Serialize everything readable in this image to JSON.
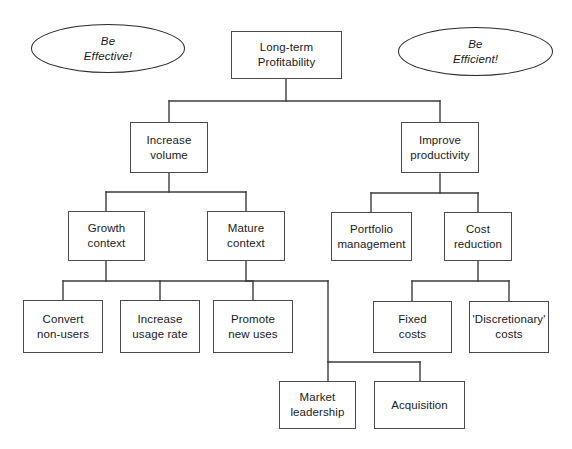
{
  "diagram": {
    "canvas": {
      "width": 572,
      "height": 449
    },
    "style": {
      "box_border_color": "#4a4a4a",
      "oval_border_color": "#2b2b2b",
      "edge_color": "#3c3c3c",
      "background": "#ffffff",
      "text_color": "#1a1a1a"
    },
    "ovals": [
      {
        "id": "be-effective",
        "label": "Be\nEffective!",
        "x": 31,
        "y": 24,
        "w": 154,
        "h": 49
      },
      {
        "id": "be-efficient",
        "label": "Be\nEfficient!",
        "x": 398,
        "y": 27,
        "w": 155,
        "h": 49
      }
    ],
    "nodes": [
      {
        "id": "long-term-profitability",
        "label": "Long-term\nProfitability",
        "level": 0,
        "x": 231,
        "y": 31,
        "w": 111,
        "h": 48
      },
      {
        "id": "increase-volume",
        "label": "Increase\nvolume",
        "level": 1,
        "x": 130,
        "y": 122,
        "w": 78,
        "h": 51
      },
      {
        "id": "improve-productivity",
        "label": "Improve\nproductivity",
        "level": 1,
        "x": 401,
        "y": 122,
        "w": 78,
        "h": 51
      },
      {
        "id": "growth-context",
        "label": "Growth\ncontext",
        "level": 2,
        "x": 68,
        "y": 211,
        "w": 77,
        "h": 50
      },
      {
        "id": "mature-context",
        "label": "Mature\ncontext",
        "level": 2,
        "x": 207,
        "y": 211,
        "w": 78,
        "h": 50
      },
      {
        "id": "portfolio-management",
        "label": "Portfolio\nmanagement",
        "level": 2,
        "x": 331,
        "y": 212,
        "w": 81,
        "h": 49
      },
      {
        "id": "cost-reduction",
        "label": "Cost\nreduction",
        "level": 2,
        "x": 444,
        "y": 212,
        "w": 68,
        "h": 49
      },
      {
        "id": "convert-non-users",
        "label": "Convert\nnon-users",
        "level": 3,
        "x": 23,
        "y": 300,
        "w": 80,
        "h": 53
      },
      {
        "id": "increase-usage-rate",
        "label": "Increase\nusage rate",
        "level": 3,
        "x": 120,
        "y": 300,
        "w": 80,
        "h": 53
      },
      {
        "id": "promote-new-uses",
        "label": "Promote\nnew uses",
        "level": 3,
        "x": 213,
        "y": 300,
        "w": 80,
        "h": 53
      },
      {
        "id": "fixed-costs",
        "label": "Fixed\ncosts",
        "level": 3,
        "x": 373,
        "y": 301,
        "w": 79,
        "h": 52
      },
      {
        "id": "discretionary-costs",
        "label": "'Discretionary'\ncosts",
        "level": 3,
        "x": 469,
        "y": 301,
        "w": 80,
        "h": 52
      },
      {
        "id": "market-leadership",
        "label": "Market\nleadership",
        "level": 4,
        "x": 279,
        "y": 381,
        "w": 77,
        "h": 48
      },
      {
        "id": "acquisition",
        "label": "Acquisition",
        "level": 4,
        "x": 374,
        "y": 381,
        "w": 91,
        "h": 48
      }
    ],
    "edges": [
      {
        "from": "long-term-profitability",
        "to": "increase-volume"
      },
      {
        "from": "long-term-profitability",
        "to": "improve-productivity"
      },
      {
        "from": "increase-volume",
        "to": "growth-context"
      },
      {
        "from": "increase-volume",
        "to": "mature-context"
      },
      {
        "from": "improve-productivity",
        "to": "portfolio-management"
      },
      {
        "from": "improve-productivity",
        "to": "cost-reduction"
      },
      {
        "from": "growth-context",
        "to": "convert-non-users"
      },
      {
        "from": "growth-context",
        "to": "increase-usage-rate"
      },
      {
        "from": "growth-context",
        "to": "promote-new-uses"
      },
      {
        "from": "cost-reduction",
        "to": "fixed-costs"
      },
      {
        "from": "cost-reduction",
        "to": "discretionary-costs"
      },
      {
        "from": "mature-context",
        "to": "market-leadership"
      },
      {
        "from": "mature-context",
        "to": "acquisition"
      }
    ],
    "edge_paths": [
      "M286,79 L286,101",
      "M169,101 L440,101",
      "M169,101 L169,122",
      "M440,101 L440,122",
      "M169,173 L169,192",
      "M106,192 L246,192",
      "M106,192 L106,211",
      "M246,192 L246,211",
      "M440,174 L440,193",
      "M371,193 L478,193",
      "M371,193 L371,212",
      "M478,193 L478,212",
      "M106,261 L106,281",
      "M63,281 L253,281",
      "M63,281 L63,300",
      "M160,281 L160,300",
      "M253,281 L253,300",
      "M478,261 L478,281",
      "M412,281 L509,281",
      "M412,281 L412,301",
      "M509,281 L509,301",
      "M246,261 L246,281",
      "M246,281 L328,281",
      "M328,281 L328,362",
      "M328,362 L420,362",
      "M328,362 L328,381",
      "M420,362 L420,381"
    ]
  }
}
